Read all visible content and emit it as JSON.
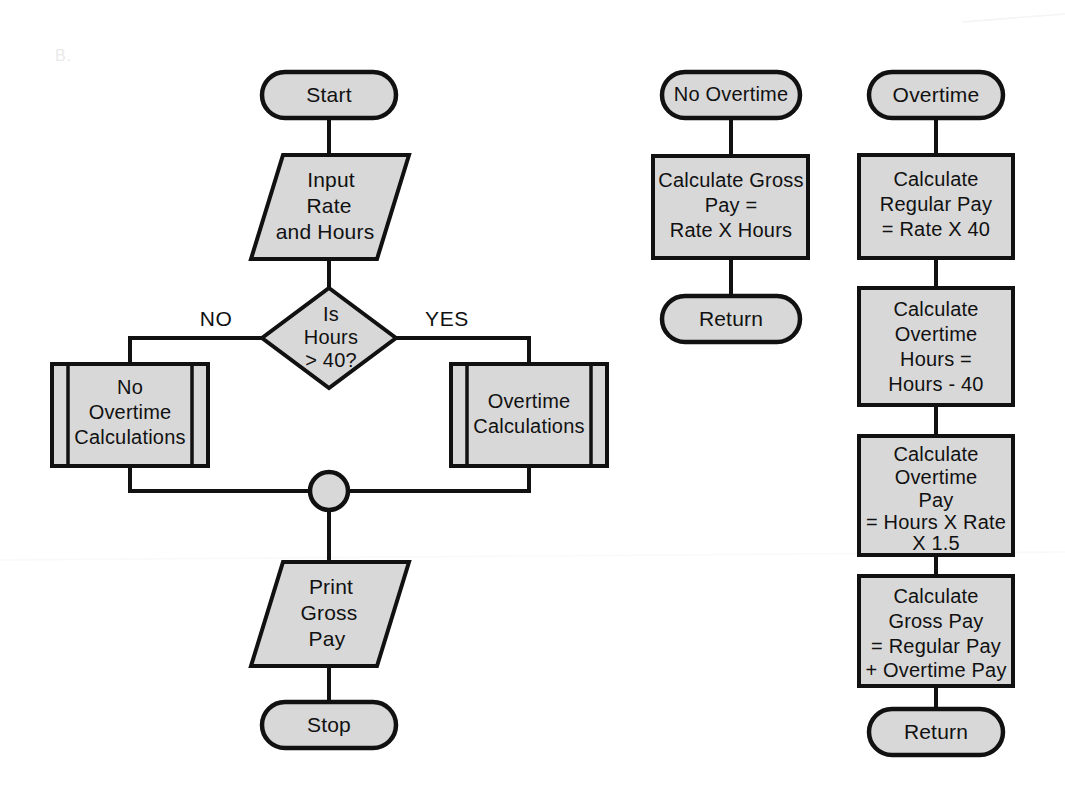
{
  "figure": {
    "section_label": "B.",
    "background_color": "#ffffff",
    "shape_fill_color": "#d8d8d8",
    "shape_stroke_color": "#111111",
    "type": "flowchart"
  },
  "main_flow": {
    "name": "Main payroll flow",
    "nodes": [
      {
        "id": "start",
        "shape": "terminator",
        "lines": [
          "Start"
        ]
      },
      {
        "id": "input-rate-hours",
        "shape": "parallelogram",
        "lines": [
          "Input",
          "Rate",
          "and Hours"
        ]
      },
      {
        "id": "is-hours-over-40",
        "shape": "decision",
        "lines": [
          "Is",
          "Hours",
          "> 40?"
        ]
      },
      {
        "id": "no-overtime-calculations",
        "shape": "predefined-process",
        "lines": [
          "No",
          "Overtime",
          "Calculations"
        ]
      },
      {
        "id": "overtime-calculations",
        "shape": "predefined-process",
        "lines": [
          "Overtime",
          "Calculations"
        ]
      },
      {
        "id": "merge-connector",
        "shape": "circle-connector",
        "lines": []
      },
      {
        "id": "print-gross-pay",
        "shape": "parallelogram",
        "lines": [
          "Print",
          "Gross",
          "Pay"
        ]
      },
      {
        "id": "stop",
        "shape": "terminator",
        "lines": [
          "Stop"
        ]
      }
    ],
    "branch_labels": {
      "no": "NO",
      "yes": "YES"
    }
  },
  "no_overtime_subroutine": {
    "name": "No Overtime subroutine",
    "nodes": [
      {
        "id": "no-overtime-entry",
        "shape": "terminator",
        "lines": [
          "No Overtime"
        ]
      },
      {
        "id": "calculate-gross-pay-regular",
        "shape": "process",
        "lines": [
          "Calculate Gross",
          "Pay  =",
          "Rate X Hours"
        ]
      },
      {
        "id": "no-overtime-return",
        "shape": "terminator",
        "lines": [
          "Return"
        ]
      }
    ]
  },
  "overtime_subroutine": {
    "name": "Overtime subroutine",
    "nodes": [
      {
        "id": "overtime-entry",
        "shape": "terminator",
        "lines": [
          "Overtime"
        ]
      },
      {
        "id": "calculate-regular-pay",
        "shape": "process",
        "lines": [
          "Calculate",
          "Regular Pay",
          "= Rate X 40"
        ]
      },
      {
        "id": "calculate-overtime-hours",
        "shape": "process",
        "lines": [
          "Calculate",
          "Overtime",
          "Hours  =",
          "Hours - 40"
        ]
      },
      {
        "id": "calculate-overtime-pay",
        "shape": "process",
        "lines": [
          "Calculate",
          "Overtime",
          "Pay",
          "= Hours X Rate",
          "X 1.5"
        ]
      },
      {
        "id": "calculate-gross-pay-total",
        "shape": "process",
        "lines": [
          "Calculate",
          "Gross Pay",
          "= Regular Pay",
          "+ Overtime Pay"
        ]
      },
      {
        "id": "overtime-return",
        "shape": "terminator",
        "lines": [
          "Return"
        ]
      }
    ]
  }
}
